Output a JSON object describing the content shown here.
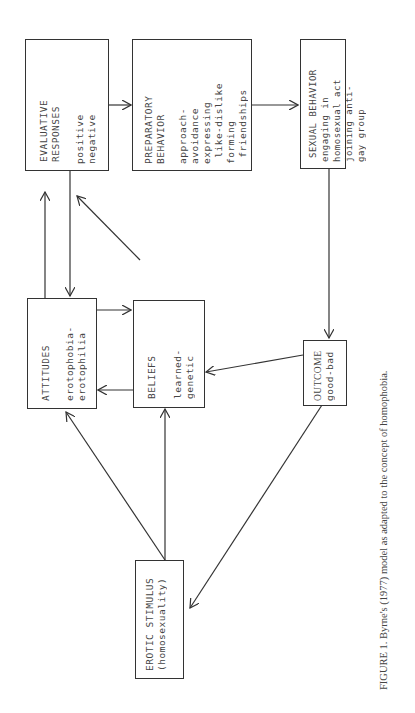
{
  "boxes": {
    "evaluative": {
      "title": "EVALUATIVE\nRESPONSES",
      "body": "positive\nnegative"
    },
    "preparatory": {
      "title": "PREPARATORY\nBEHAVIOR",
      "body": "approach-\navoidance\nexpressing\n like-dislike\nforming\n friendships"
    },
    "sexual": {
      "title": "SEXUAL BEHAVIOR",
      "body": "engaging in\nhomosexual act\njoining anti-\ngay group"
    },
    "attitudes": {
      "title": "ATTITUDES",
      "body": "erotophobia-\nerotophilia"
    },
    "beliefs": {
      "title": "BELIEFS",
      "body": "learned-\ngenetic"
    },
    "outcome": {
      "title": "OUTCOME",
      "body": "good-bad"
    },
    "erotic": {
      "title": "EROTIC STIMULUS",
      "body": "(homosexuality)"
    }
  },
  "caption": "FIGURE 1. Byrne's (1977) model as adapted to the concept of homophobia."
}
